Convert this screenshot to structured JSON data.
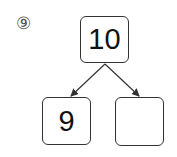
{
  "problem": {
    "number_label": "⑨",
    "top_value": "10",
    "bottom_left_value": "9",
    "bottom_right_value": ""
  }
}
